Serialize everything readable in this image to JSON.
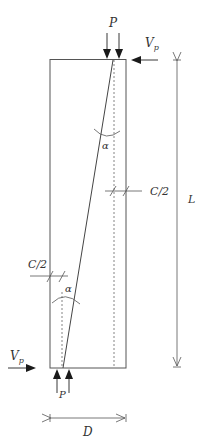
{
  "diagram": {
    "labels": {
      "top_load": "P",
      "bottom_load": "P",
      "top_shear": "V",
      "top_shear_sub": "p",
      "bottom_shear": "V",
      "bottom_shear_sub": "p",
      "angle_top": "α",
      "angle_bottom": "α",
      "half_c_right": "C/2",
      "half_c_left": "C/2",
      "length": "L",
      "depth": "D"
    },
    "colors": {
      "line": "#555555",
      "arrow": "#1a1a1a",
      "text": "#333333"
    }
  }
}
